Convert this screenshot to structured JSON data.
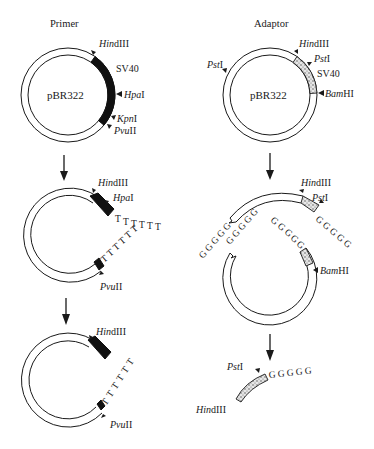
{
  "titles": {
    "left": "Primer",
    "right": "Adaptor"
  },
  "plasmid_label": "pBR322",
  "insert_label": "SV40",
  "sites": {
    "hindiii": {
      "italic": "Hin",
      "roman": "dIII"
    },
    "hpai": {
      "italic": "Hpa",
      "roman": "I"
    },
    "kpni": {
      "italic": "Kpn",
      "roman": "I"
    },
    "pvuii": {
      "italic": "Pvu",
      "roman": "II"
    },
    "psti": {
      "italic": "Pst",
      "roman": "I"
    },
    "bamhi": {
      "italic": "Bam",
      "roman": "HI"
    }
  },
  "tails": {
    "t": "T",
    "g": "G",
    "t_tail_count": 6,
    "g_tail_count": 5
  },
  "left_column": {
    "step1": {
      "ring": "pBR322",
      "insert": "SV40",
      "insert_style": "solid-black",
      "sites": [
        "HindIII",
        "HpaI",
        "KpnI",
        "PvuII"
      ]
    },
    "step2": {
      "description": "linearized at KpnI, oligo(dT) tails added",
      "sites": [
        "HindIII",
        "HpaI",
        "PvuII"
      ],
      "tail": "TTTTTT"
    },
    "step3": {
      "description": "HpaI fragment removed, primer with oligo(dT) tail",
      "sites": [
        "HindIII",
        "PvuII"
      ],
      "tail": "TTTTTT"
    }
  },
  "right_column": {
    "step1": {
      "ring": "pBR322",
      "insert": "SV40",
      "insert_style": "stippled",
      "sites": [
        "PstI",
        "HindIII",
        "PstI",
        "BamHI"
      ]
    },
    "step2": {
      "description": "cut at PstI, oligo(dG) tails added",
      "sites": [
        "HindIII",
        "PstI",
        "BamHI"
      ],
      "tail": "GGGGG"
    },
    "step3": {
      "description": "HindIII–PstI adaptor fragment with oligo(dG) tail",
      "sites": [
        "PstI",
        "HindIII"
      ],
      "tail": "GGGGG"
    }
  }
}
